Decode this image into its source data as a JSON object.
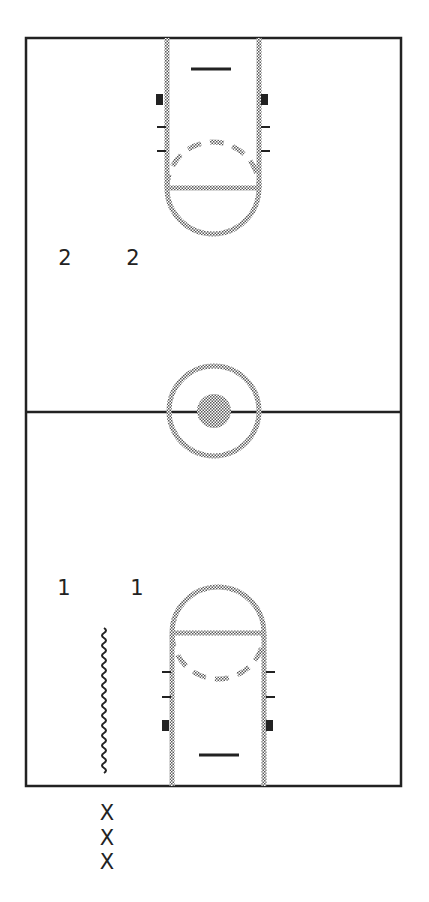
{
  "diagram": {
    "type": "basketball-half-court-drill",
    "colors": {
      "line": "#222222",
      "painted": "#9a9a9a",
      "background": "#ffffff"
    }
  },
  "court": {
    "boundary": {
      "x1": 26,
      "y1": 38,
      "x2": 401,
      "y2": 786
    },
    "center_line_y": 412,
    "center_circle": {
      "cx": 214,
      "cy": 411,
      "r": 45,
      "inner_r": 17
    }
  },
  "players": {
    "team_2": [
      {
        "label": "2",
        "x": 65,
        "y": 258
      },
      {
        "label": "2",
        "x": 133,
        "y": 258
      }
    ],
    "team_1": [
      {
        "label": "1",
        "x": 64,
        "y": 588
      },
      {
        "label": "1",
        "x": 137,
        "y": 588
      }
    ],
    "line_x": [
      {
        "label": "X",
        "x": 107,
        "y": 813
      },
      {
        "label": "X",
        "x": 107,
        "y": 838
      },
      {
        "label": "X",
        "x": 107,
        "y": 862
      }
    ]
  },
  "dribble_path": {
    "x": 104,
    "y1": 628,
    "y2": 775
  }
}
